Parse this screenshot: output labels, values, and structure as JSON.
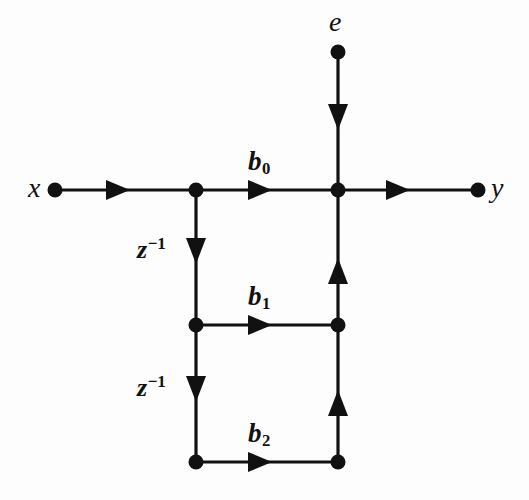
{
  "figure": {
    "type": "signal-flow-graph",
    "background_color": "#fdfdfd",
    "ink_color": "#111111"
  },
  "nodes": [
    {
      "id": "x",
      "label": "x",
      "label_side": "left",
      "x": 55,
      "y": 190,
      "role": "input-terminal"
    },
    {
      "id": "tap0",
      "label": "",
      "label_side": "none",
      "x": 196,
      "y": 190,
      "role": "branch-node"
    },
    {
      "id": "sum",
      "label": "",
      "label_side": "none",
      "x": 338,
      "y": 190,
      "role": "summing-node"
    },
    {
      "id": "y",
      "label": "y",
      "label_side": "right",
      "x": 478,
      "y": 190,
      "role": "output-terminal"
    },
    {
      "id": "e",
      "label": "e",
      "label_side": "above",
      "x": 338,
      "y": 52,
      "role": "input-terminal"
    },
    {
      "id": "tap1",
      "label": "",
      "label_side": "none",
      "x": 196,
      "y": 325,
      "role": "branch-node"
    },
    {
      "id": "join1",
      "label": "",
      "label_side": "none",
      "x": 338,
      "y": 325,
      "role": "summing-node"
    },
    {
      "id": "tap2",
      "label": "",
      "label_side": "none",
      "x": 196,
      "y": 462,
      "role": "branch-node"
    },
    {
      "id": "join2",
      "label": "",
      "label_side": "none",
      "x": 338,
      "y": 462,
      "role": "summing-node"
    }
  ],
  "edges": [
    {
      "id": "x-to-tap0",
      "from": "x",
      "to": "tap0",
      "orientation": "horizontal",
      "direction": "right",
      "gain": "",
      "arrow_at": 120
    },
    {
      "id": "tap0-to-sum",
      "from": "tap0",
      "to": "sum",
      "orientation": "horizontal",
      "direction": "right",
      "gain": "b0",
      "arrow_at": 262
    },
    {
      "id": "sum-to-y",
      "from": "sum",
      "to": "y",
      "orientation": "horizontal",
      "direction": "right",
      "gain": "",
      "arrow_at": 400
    },
    {
      "id": "e-to-sum",
      "from": "e",
      "to": "sum",
      "orientation": "vertical",
      "direction": "down",
      "gain": "",
      "arrow_at": 118
    },
    {
      "id": "tap0-to-tap1",
      "from": "tap0",
      "to": "tap1",
      "orientation": "vertical",
      "direction": "down",
      "gain": "z-1",
      "arrow_at": 252
    },
    {
      "id": "tap1-to-tap2",
      "from": "tap1",
      "to": "tap2",
      "orientation": "vertical",
      "direction": "down",
      "gain": "z-1",
      "arrow_at": 390
    },
    {
      "id": "tap1-to-join1",
      "from": "tap1",
      "to": "join1",
      "orientation": "horizontal",
      "direction": "right",
      "gain": "b1",
      "arrow_at": 262
    },
    {
      "id": "tap2-to-join2",
      "from": "tap2",
      "to": "join2",
      "orientation": "horizontal",
      "direction": "right",
      "gain": "b2",
      "arrow_at": 262
    },
    {
      "id": "join1-to-sum",
      "from": "join1",
      "to": "sum",
      "orientation": "vertical",
      "direction": "up",
      "gain": "",
      "arrow_at": 270
    },
    {
      "id": "join2-to-join1",
      "from": "join2",
      "to": "join1",
      "orientation": "vertical",
      "direction": "up",
      "gain": "",
      "arrow_at": 402
    }
  ],
  "labels": {
    "input_x": "x",
    "input_e": "e",
    "output_y": "y",
    "coef_b0_base": "b",
    "coef_b0_sub": "0",
    "coef_b1_base": "b",
    "coef_b1_sub": "1",
    "coef_b2_base": "b",
    "coef_b2_sub": "2",
    "delay_1_base": "z",
    "delay_1_sup": "−1",
    "delay_2_base": "z",
    "delay_2_sup": "−1"
  }
}
